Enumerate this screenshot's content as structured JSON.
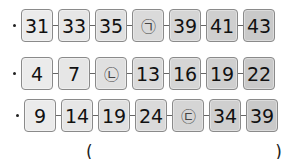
{
  "rows": [
    {
      "cells": [
        {
          "label": "31",
          "type": "number"
        },
        {
          "label": "33",
          "type": "number"
        },
        {
          "label": "35",
          "type": "number"
        },
        {
          "label": "㉠",
          "type": "blank"
        },
        {
          "label": "39",
          "type": "number"
        },
        {
          "label": "41",
          "type": "number"
        },
        {
          "label": "43",
          "type": "number"
        }
      ]
    },
    {
      "cells": [
        {
          "label": "4",
          "type": "number"
        },
        {
          "label": "7",
          "type": "number"
        },
        {
          "label": "㉡",
          "type": "blank"
        },
        {
          "label": "13",
          "type": "number"
        },
        {
          "label": "16",
          "type": "number"
        },
        {
          "label": "19",
          "type": "number"
        },
        {
          "label": "22",
          "type": "number"
        }
      ]
    },
    {
      "cells": [
        {
          "label": "9",
          "type": "number"
        },
        {
          "label": "14",
          "type": "number"
        },
        {
          "label": "19",
          "type": "number"
        },
        {
          "label": "24",
          "type": "number"
        },
        {
          "label": "㉢",
          "type": "blank"
        },
        {
          "label": "34",
          "type": "number"
        },
        {
          "label": "39",
          "type": "number"
        }
      ]
    }
  ],
  "answer": {
    "open_paren": "(",
    "close_paren": ")",
    "value": ""
  },
  "colors": {
    "cell_light": "#ebebeb",
    "cell_dark": "#c9c9c9",
    "cell_border": "#8a8a8a",
    "text": "#111111"
  }
}
